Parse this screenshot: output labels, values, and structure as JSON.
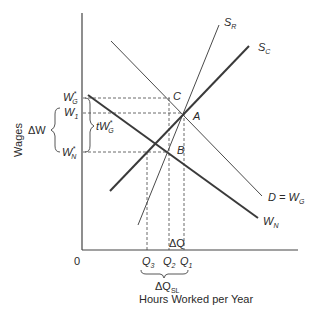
{
  "diagram": {
    "axes": {
      "y_title": "Wages",
      "x_title": "Hours Worked per Year",
      "origin": "0"
    },
    "curves": {
      "s_r": {
        "label": "S",
        "sub": "R"
      },
      "s_c": {
        "label": "S",
        "sub": "C"
      },
      "demand": {
        "label": "D = W",
        "sub": "G"
      },
      "w_n": {
        "label": "W",
        "sub": "N"
      }
    },
    "points": {
      "c": "C",
      "a": "A",
      "b": "B"
    },
    "y_labels": {
      "wg_star": {
        "label": "W",
        "sub": "G",
        "sup": "*"
      },
      "w1": {
        "label": "W",
        "sub": "1"
      },
      "wn_star": {
        "label": "W",
        "sub": "N",
        "sup": "*"
      },
      "delta_w": "ΔW",
      "tax_wedge": {
        "label": "tW",
        "sub": "G",
        "sup": "*"
      }
    },
    "x_labels": {
      "q3": {
        "label": "Q",
        "sub": "3"
      },
      "q2": {
        "label": "Q",
        "sub": "2"
      },
      "q1": {
        "label": "Q",
        "sub": "1"
      },
      "delta_q": "ΔQ",
      "delta_q_sl": {
        "label": "ΔQ",
        "sub": "SL"
      }
    }
  }
}
